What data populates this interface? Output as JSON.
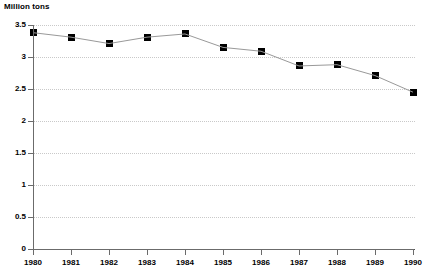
{
  "chart_data": {
    "type": "line",
    "title": "",
    "ylabel": "Million tons",
    "xlabel": "",
    "categories": [
      "1980",
      "1981",
      "1982",
      "1983",
      "1984",
      "1985",
      "1986",
      "1987",
      "1988",
      "1989",
      "1990"
    ],
    "values": [
      3.38,
      3.31,
      3.21,
      3.31,
      3.36,
      3.15,
      3.09,
      2.86,
      2.88,
      2.71,
      2.45
    ],
    "series": [
      {
        "name": "Million tons",
        "values": [
          3.38,
          3.31,
          3.21,
          3.31,
          3.36,
          3.15,
          3.09,
          2.86,
          2.88,
          2.71,
          2.45
        ]
      }
    ],
    "ylim": [
      0,
      3.5
    ],
    "yticks": [
      0,
      0.5,
      1,
      1.5,
      2,
      2.5,
      3,
      3.5
    ],
    "ytick_labels": [
      "0",
      "0.5",
      "1",
      "1.5",
      "2",
      "2.5",
      "3",
      "3.5"
    ],
    "grid": "horizontal-dotted",
    "legend": "none",
    "marker": "square",
    "line_color": "#999999",
    "marker_color": "#000000",
    "grid_color": "#c9c9c9",
    "axis_color": "#6b6b6b",
    "background_color": "#ffffff"
  }
}
